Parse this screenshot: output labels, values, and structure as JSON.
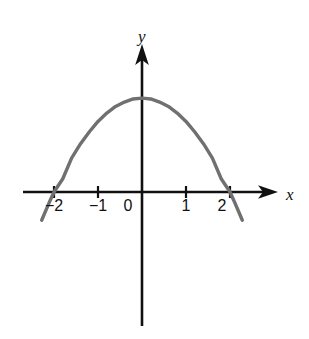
{
  "figure": {
    "background_color": "#ffffff",
    "width": 309,
    "height": 339
  },
  "axes": {
    "x_axis_label": "x",
    "y_axis_label": "y",
    "axis_color": "#111111",
    "x_axis_has_arrow": true,
    "y_axis_has_arrow": true,
    "origin_label": "0"
  },
  "x_ticks": [
    {
      "label": "−2",
      "value": -2
    },
    {
      "label": "−1",
      "value": -1
    },
    {
      "label": "0",
      "value": 0
    },
    {
      "label": "1",
      "value": 1
    },
    {
      "label": "2",
      "value": 2
    }
  ],
  "chart_data": {
    "type": "line",
    "title": "",
    "xlabel": "x",
    "ylabel": "y",
    "curve_color": "#707070",
    "grid": false,
    "legend": "none",
    "xlim": [
      -2.3,
      2.3
    ],
    "ylim": [
      -2.4,
      2.4
    ],
    "series": [
      {
        "name": "parabola",
        "equation": "y = 2.13 × (1 − x²/4)",
        "roots": [
          -2,
          2
        ],
        "vertex": [
          0,
          2.13
        ],
        "opens": "down",
        "x": [
          -2.28,
          -2.1,
          -2.0,
          -1.8,
          -1.6,
          -1.4,
          -1.2,
          -1.0,
          -0.8,
          -0.6,
          -0.4,
          -0.2,
          0.0,
          0.2,
          0.4,
          0.6,
          0.8,
          1.0,
          1.2,
          1.4,
          1.6,
          1.8,
          2.0,
          2.1,
          2.28
        ],
        "y": [
          -0.64,
          -0.22,
          0.0,
          0.3,
          0.77,
          1.09,
          1.36,
          1.6,
          1.79,
          1.94,
          2.04,
          2.11,
          2.13,
          2.11,
          2.04,
          1.94,
          1.79,
          1.6,
          1.36,
          1.09,
          0.77,
          0.3,
          0.0,
          -0.22,
          -0.64
        ]
      }
    ]
  }
}
